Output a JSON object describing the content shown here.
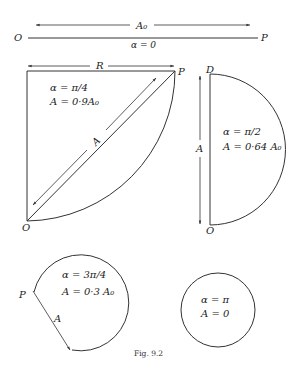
{
  "figure": {
    "caption": "Fig. 9.2",
    "panels": [
      {
        "id": "alpha-0",
        "shape": "straight line",
        "start_label": "O",
        "end_label": "P",
        "arrow_label": "A₀",
        "alpha_label": "α = 0"
      },
      {
        "id": "alpha-pi-4",
        "shape": "quarter circle",
        "radius_label": "R",
        "corner_label": "P",
        "origin_label": "O",
        "chord_label": "A",
        "alpha_label": "α = π/4",
        "amplitude_label": "A = 0·9A₀"
      },
      {
        "id": "alpha-pi-2",
        "shape": "semicircle",
        "top_label": "D",
        "bottom_label": "O",
        "chord_label": "A",
        "alpha_label": "α = π/2",
        "amplitude_label": "A = 0·64 A₀"
      },
      {
        "id": "alpha-3pi-4",
        "shape": "three-quarter circle",
        "point_label": "P",
        "chord_label": "A",
        "alpha_label": "α = 3π/4",
        "amplitude_label": "A = 0·3 A₀"
      },
      {
        "id": "alpha-pi",
        "shape": "full circle",
        "alpha_label": "α = π",
        "amplitude_label": "A = 0"
      }
    ]
  }
}
